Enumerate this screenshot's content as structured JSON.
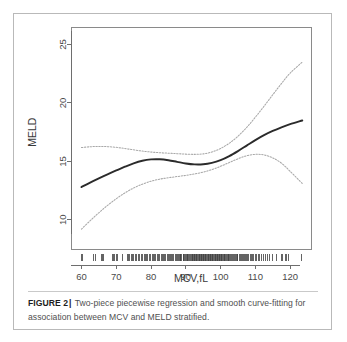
{
  "figure": {
    "label": "FIGURE 2",
    "separator": "|",
    "caption": "Two-piece piecewise regression and smooth curve-fitting for association between MCV and MELD stratified."
  },
  "colors": {
    "main_curve": "#2b2b2b",
    "ci_curve": "#a8a8a8",
    "axis": "#6e6e6e",
    "frame": "#8a8a8a",
    "rug": "#3d3d3d",
    "panel_border": "#b9b9b9",
    "background": "#ffffff",
    "caption_text": "#4f4f4f"
  },
  "chart_data": {
    "type": "line",
    "title": "",
    "xlabel": "MCV,fL",
    "ylabel": "MELD",
    "xlim": [
      57,
      126
    ],
    "ylim": [
      7.5,
      26.5
    ],
    "xticks": [
      60,
      70,
      80,
      90,
      100,
      110,
      120
    ],
    "yticks": [
      10,
      15,
      20,
      25
    ],
    "grid": false,
    "legend": "none",
    "series": [
      {
        "name": "Smooth fitted curve",
        "style": "solid",
        "x": [
          60.0,
          62.5,
          65.0,
          67.5,
          70.0,
          72.5,
          75.0,
          77.5,
          80.0,
          82.5,
          85.0,
          87.5,
          90.0,
          92.5,
          95.0,
          97.5,
          100.0,
          102.5,
          105.0,
          107.5,
          110.0,
          112.5,
          115.0,
          117.5,
          120.0,
          123.5
        ],
        "y": [
          12.8,
          13.18,
          13.54,
          13.89,
          14.22,
          14.54,
          14.83,
          15.05,
          15.17,
          15.18,
          15.1,
          14.96,
          14.82,
          14.74,
          14.75,
          14.87,
          15.1,
          15.45,
          15.88,
          16.35,
          16.82,
          17.24,
          17.6,
          17.91,
          18.18,
          18.5
        ]
      },
      {
        "name": "Upper 95% confidence limit",
        "style": "dotted",
        "x": [
          60.0,
          62.5,
          65.0,
          67.5,
          70.0,
          72.5,
          75.0,
          77.5,
          80.0,
          82.5,
          85.0,
          87.5,
          90.0,
          92.5,
          95.0,
          97.5,
          100.0,
          102.5,
          105.0,
          107.5,
          110.0,
          112.5,
          115.0,
          117.5,
          120.0,
          123.5
        ],
        "y": [
          16.18,
          16.25,
          16.28,
          16.26,
          16.2,
          16.1,
          15.99,
          15.88,
          15.8,
          15.74,
          15.7,
          15.66,
          15.62,
          15.6,
          15.64,
          15.8,
          16.1,
          16.55,
          17.15,
          17.9,
          18.78,
          19.72,
          20.7,
          21.66,
          22.55,
          23.5
        ]
      },
      {
        "name": "Lower 95% confidence limit",
        "style": "dotted",
        "x": [
          60.0,
          62.5,
          65.0,
          67.5,
          70.0,
          72.5,
          75.0,
          77.5,
          80.0,
          82.5,
          85.0,
          87.5,
          90.0,
          92.5,
          95.0,
          97.5,
          100.0,
          102.5,
          105.0,
          107.5,
          110.0,
          112.5,
          115.0,
          117.5,
          120.0,
          123.5
        ],
        "y": [
          9.2,
          9.92,
          10.6,
          11.23,
          11.8,
          12.3,
          12.72,
          13.05,
          13.3,
          13.48,
          13.6,
          13.7,
          13.8,
          13.92,
          14.08,
          14.3,
          14.58,
          14.9,
          15.22,
          15.48,
          15.6,
          15.55,
          15.3,
          14.85,
          14.15,
          13.1
        ]
      }
    ],
    "rug": {
      "name": "MCV observations rug plot",
      "values": [
        60.0,
        60.4,
        63.6,
        63.9,
        65.8,
        66.1,
        66.4,
        68.9,
        69.2,
        69.5,
        70.1,
        70.5,
        71.8,
        73.2,
        73.5,
        73.9,
        74.3,
        74.8,
        75.1,
        75.5,
        75.9,
        76.3,
        76.8,
        77.2,
        77.6,
        78.0,
        78.4,
        78.8,
        79.1,
        79.5,
        79.9,
        80.3,
        80.7,
        81.0,
        81.4,
        81.8,
        82.1,
        82.5,
        82.9,
        83.2,
        83.6,
        84.0,
        84.3,
        84.7,
        85.0,
        85.3,
        85.6,
        86.0,
        86.3,
        86.6,
        86.9,
        87.2,
        87.5,
        87.8,
        88.1,
        88.4,
        88.6,
        88.9,
        89.2,
        89.4,
        89.7,
        89.9,
        90.2,
        90.4,
        90.6,
        90.9,
        91.1,
        91.3,
        91.5,
        91.8,
        92.0,
        92.2,
        92.4,
        92.6,
        92.8,
        93.0,
        93.2,
        93.4,
        93.6,
        93.8,
        94.0,
        94.2,
        94.4,
        94.6,
        94.8,
        95.0,
        95.2,
        95.4,
        95.6,
        95.8,
        96.0,
        96.2,
        96.4,
        96.6,
        96.8,
        97.0,
        97.2,
        97.4,
        97.6,
        97.8,
        98.0,
        98.2,
        98.4,
        98.6,
        98.8,
        99.0,
        99.2,
        99.4,
        99.6,
        99.8,
        100.0,
        100.2,
        100.4,
        100.6,
        100.8,
        101.0,
        101.2,
        101.5,
        101.7,
        101.9,
        102.2,
        102.4,
        102.7,
        102.9,
        103.2,
        103.4,
        103.7,
        103.9,
        104.2,
        104.5,
        104.8,
        105.0,
        105.3,
        105.6,
        105.9,
        106.2,
        106.5,
        106.8,
        107.1,
        107.4,
        107.8,
        108.1,
        108.5,
        108.8,
        109.2,
        109.6,
        110.0,
        110.4,
        110.8,
        111.2,
        111.7,
        112.2,
        112.8,
        113.4,
        114.1,
        114.9,
        116.2,
        117.4,
        117.8,
        118.6,
        119.0,
        119.4,
        123.4
      ]
    }
  }
}
